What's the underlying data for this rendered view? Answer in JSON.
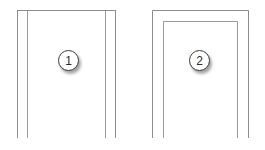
{
  "canvas": {
    "width": 265,
    "height": 150,
    "background": "#ffffff",
    "line_color": "#8c8c8c",
    "line_color_dark": "#7a7a7a",
    "line_width": 1
  },
  "figure": {
    "type": "cross-section-callout-diagram",
    "title": "",
    "shapes": [
      {
        "id": "shape-1",
        "name": "left-profile-section",
        "description": "open-bottom channel profile with two nested vertical webs",
        "outline": {
          "top_y": 10,
          "bottom_y": 138,
          "outer_left_x": 17,
          "inner_left_x": 27,
          "inner_right_x": 105,
          "outer_right_x": 116
        },
        "callout": "1"
      },
      {
        "id": "shape-2",
        "name": "right-profile-section",
        "description": "open-bottom nested U frame profile",
        "outline": {
          "outer_top_y": 10,
          "inner_top_y": 21,
          "bottom_y": 138,
          "outer_left_x": 152,
          "inner_left_x": 163,
          "inner_right_x": 238,
          "outer_right_x": 249
        },
        "callout": "2"
      }
    ]
  },
  "callouts": [
    {
      "label": "1",
      "name": "callout-badge-1",
      "x": 58,
      "y": 50,
      "target_shape": "left-profile-section"
    },
    {
      "label": "2",
      "name": "callout-badge-2",
      "x": 189,
      "y": 50,
      "target_shape": "right-profile-section"
    }
  ]
}
